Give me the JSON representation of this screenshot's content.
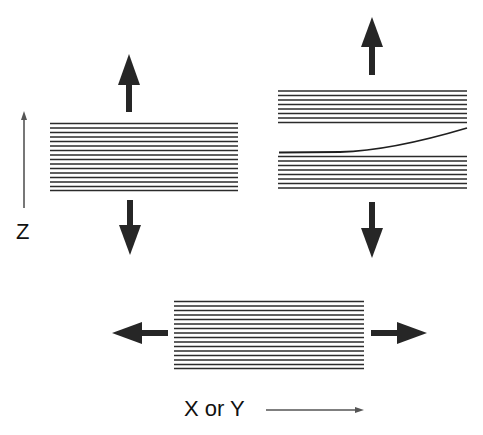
{
  "diagram": {
    "title": "",
    "labels": {
      "z_axis": "Z",
      "xy_axis": "X or Y"
    },
    "colors": {
      "lines": "#2b2b2b",
      "arrows": "#262626",
      "axis_arrows": "#555555",
      "background": "#ffffff"
    },
    "panels": [
      {
        "id": "z-tension-intact",
        "description": "Stack of 16 layers with outward arrows in Z direction",
        "layer_count": 16,
        "arrows": [
          "up",
          "down"
        ]
      },
      {
        "id": "z-tension-delaminated",
        "description": "Stack split into 8 upper layers and 9 lower layers; top lower layer peels upward on right side",
        "upper_layer_count": 8,
        "lower_layer_count": 9,
        "arrows": [
          "up",
          "down"
        ]
      },
      {
        "id": "xy-tension",
        "description": "Stack of 16 layers with outward arrows in X or Y direction",
        "layer_count": 16,
        "arrows": [
          "left",
          "right"
        ]
      }
    ]
  }
}
